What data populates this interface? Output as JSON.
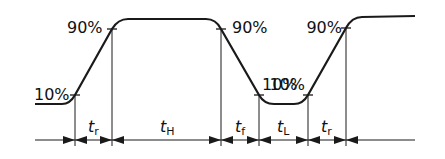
{
  "diagram": {
    "type": "pulse-timing-waveform",
    "level_labels": {
      "rise1_low": "10%",
      "rise1_high": "90%",
      "fall_high": "90%",
      "fall_low": "10%",
      "rise2_low": "10%",
      "rise2_high": "90%"
    },
    "intervals": [
      {
        "var": "t",
        "sub": "r",
        "meaning": "rise time"
      },
      {
        "var": "t",
        "sub": "H",
        "meaning": "high time"
      },
      {
        "var": "t",
        "sub": "f",
        "meaning": "fall time"
      },
      {
        "var": "t",
        "sub": "L",
        "meaning": "low time"
      },
      {
        "var": "t",
        "sub": "r",
        "meaning": "rise time"
      }
    ],
    "colors": {
      "stroke": "#1a1a1a",
      "background": "#ffffff"
    }
  }
}
